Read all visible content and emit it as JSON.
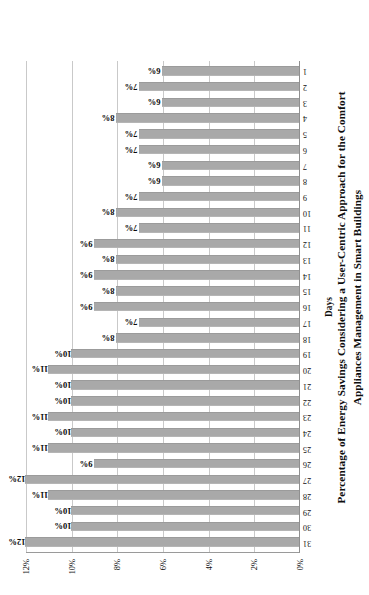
{
  "chart_data": {
    "type": "bar",
    "title": "Percentage of Energy Savings Considering a User-Centric Approach for the Comfort Appliances Management in Smart Buildings",
    "title_lines": [
      "Percentage of Energy Savings Considering a User-Centric Approach for the Comfort",
      "Appliances Management in Smart Buildings"
    ],
    "xlabel": "Days",
    "ylabel": "",
    "ylim": [
      0,
      12
    ],
    "ytick_labels": [
      "0%",
      "2%",
      "4%",
      "6%",
      "8%",
      "10%",
      "12%"
    ],
    "ytick_values": [
      0,
      2,
      4,
      6,
      8,
      10,
      12
    ],
    "grid": true,
    "legend": null,
    "orientation": "vertical-bars-rotated-page",
    "bar_color": "#a9a9a9",
    "data_labels_suffix": "%",
    "categories": [
      "31",
      "30",
      "29",
      "28",
      "27",
      "26",
      "25",
      "24",
      "23",
      "22",
      "21",
      "20",
      "19",
      "18",
      "17",
      "16",
      "15",
      "14",
      "13",
      "12",
      "11",
      "10",
      "9",
      "8",
      "7",
      "6",
      "5",
      "4",
      "3",
      "2",
      "1"
    ],
    "values": [
      12,
      10,
      10,
      11,
      12,
      9,
      11,
      10,
      11,
      10,
      10,
      11,
      10,
      8,
      7,
      9,
      8,
      9,
      8,
      9,
      7,
      8,
      7,
      6,
      6,
      7,
      7,
      8,
      6,
      7,
      6
    ],
    "data_labels": [
      "12%",
      "10%",
      "10%",
      "11%",
      "12%",
      "9%",
      "11%",
      "10%",
      "11%",
      "10%",
      "10%",
      "11%",
      "10%",
      "8%",
      "7%",
      "9%",
      "8%",
      "9%",
      "8%",
      "9%",
      "7%",
      "8%",
      "7%",
      "6%",
      "6%",
      "7%",
      "7%",
      "8%",
      "6%",
      "7%",
      "6%"
    ]
  }
}
